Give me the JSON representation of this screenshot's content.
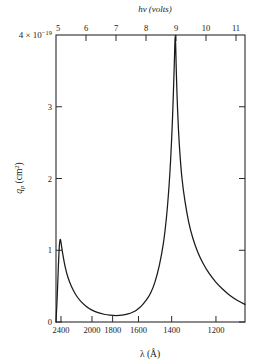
{
  "figure": {
    "top_axis_title": "hν (volts)",
    "bottom_axis_title": "λ (Å)",
    "y_axis_title": "q_p (cm2)",
    "y_scale_note": "4 × 10−19"
  },
  "chart_data": {
    "type": "line",
    "title": "",
    "subtitle": "",
    "xlabel": "λ (Å)",
    "xlabel_top": "hν (volts)",
    "ylabel": "q_p (cm2)",
    "y_multiplier": "1e-19",
    "y_multiplier_label": "4 × 10−19",
    "grid": false,
    "legend": false,
    "xlim_energy_volts": [
      5.0,
      11.3
    ],
    "ylim": [
      0,
      4
    ],
    "x_axis_linear_in": "photon energy (hv, volts)",
    "top_ticks_volts": [
      5,
      6,
      7,
      8,
      9,
      10,
      11
    ],
    "top_tick_labels": [
      "5",
      "6",
      "7",
      "8",
      "9",
      "10",
      "11"
    ],
    "bottom_tick_labels": [
      "2400",
      "2000",
      "1800",
      "1600",
      "1400",
      "1200"
    ],
    "bottom_ticks_angstrom": [
      2400,
      2000,
      1800,
      1600,
      1400,
      1200
    ],
    "bottom_ticks_volts": [
      5.166,
      6.199,
      6.888,
      7.749,
      8.856,
      10.332
    ],
    "y_ticks": [
      0,
      1,
      2,
      3,
      4
    ],
    "y_tick_labels": [
      "0",
      "1",
      "2",
      "3",
      "4"
    ],
    "series": [
      {
        "name": "photoionization cross section",
        "comment": "points are (photon energy in volts, q_p in units of 1e-19 cm2)",
        "points": [
          [
            5.0,
            0.0
          ],
          [
            5.04,
            0.35
          ],
          [
            5.08,
            0.78
          ],
          [
            5.11,
            1.05
          ],
          [
            5.14,
            1.15
          ],
          [
            5.17,
            1.1
          ],
          [
            5.22,
            0.96
          ],
          [
            5.3,
            0.78
          ],
          [
            5.4,
            0.62
          ],
          [
            5.52,
            0.49
          ],
          [
            5.66,
            0.38
          ],
          [
            5.82,
            0.29
          ],
          [
            6.0,
            0.22
          ],
          [
            6.2,
            0.165
          ],
          [
            6.4,
            0.13
          ],
          [
            6.6,
            0.108
          ],
          [
            6.8,
            0.095
          ],
          [
            7.0,
            0.09
          ],
          [
            7.2,
            0.095
          ],
          [
            7.4,
            0.112
          ],
          [
            7.55,
            0.135
          ],
          [
            7.7,
            0.172
          ],
          [
            7.85,
            0.225
          ],
          [
            8.0,
            0.3
          ],
          [
            8.15,
            0.4
          ],
          [
            8.3,
            0.56
          ],
          [
            8.45,
            0.8
          ],
          [
            8.58,
            1.1
          ],
          [
            8.68,
            1.45
          ],
          [
            8.76,
            1.85
          ],
          [
            8.82,
            2.25
          ],
          [
            8.87,
            2.7
          ],
          [
            8.91,
            3.15
          ],
          [
            8.94,
            3.55
          ],
          [
            8.96,
            3.85
          ],
          [
            8.975,
            4.0
          ],
          [
            8.99,
            3.85
          ],
          [
            9.01,
            3.5
          ],
          [
            9.04,
            3.1
          ],
          [
            9.08,
            2.7
          ],
          [
            9.13,
            2.35
          ],
          [
            9.2,
            2.0
          ],
          [
            9.3,
            1.68
          ],
          [
            9.42,
            1.4
          ],
          [
            9.56,
            1.17
          ],
          [
            9.72,
            0.98
          ],
          [
            9.9,
            0.82
          ],
          [
            10.1,
            0.68
          ],
          [
            10.32,
            0.56
          ],
          [
            10.55,
            0.46
          ],
          [
            10.8,
            0.37
          ],
          [
            11.05,
            0.3
          ],
          [
            11.3,
            0.245
          ]
        ]
      }
    ],
    "annotations": [
      {
        "label": "sharp threshold peak near 2400 Å",
        "energy_volts": 5.14,
        "value": 1.15
      },
      {
        "label": "minimum near 1800 Å",
        "energy_volts": 7.0,
        "value": 0.09
      },
      {
        "label": "main resonance peak near 1380 Å",
        "energy_volts": 8.975,
        "value": 4.0
      }
    ]
  }
}
